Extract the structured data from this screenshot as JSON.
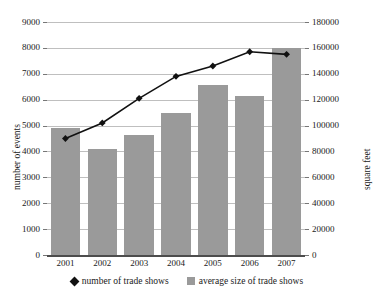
{
  "chart_data": {
    "type": "bar",
    "title": "",
    "categories": [
      "2001",
      "2002",
      "2003",
      "2004",
      "2005",
      "2006",
      "2007"
    ],
    "series": [
      {
        "name": "number of trade shows",
        "type": "line",
        "axis": "left",
        "marker": "diamond",
        "color": "#111111",
        "values": [
          4500,
          5100,
          6050,
          6900,
          7300,
          7850,
          7750
        ]
      },
      {
        "name": "average size of trade shows",
        "type": "bar",
        "axis": "right",
        "color": "#9a9a9a",
        "values": [
          98000,
          82000,
          93000,
          110000,
          131000,
          123000,
          160000
        ]
      }
    ],
    "xlabel": "",
    "ylabel": "number of events",
    "ylabel_right": "square feet",
    "ylim": [
      0,
      9000
    ],
    "ylim_right": [
      0,
      180000
    ],
    "yticks": [
      0,
      1000,
      2000,
      3000,
      4000,
      5000,
      6000,
      7000,
      8000,
      9000
    ],
    "yticks_right": [
      0,
      20000,
      40000,
      60000,
      80000,
      100000,
      120000,
      140000,
      160000,
      180000
    ],
    "ytick_labels": [
      "0",
      "1000",
      "2000",
      "3000",
      "4000",
      "5000",
      "6000",
      "7000",
      "8000",
      "9000"
    ],
    "ytick_labels_right": [
      "0",
      "20000",
      "40000",
      "60000",
      "80000",
      "100000",
      "120000",
      "140000",
      "160000",
      "180000"
    ],
    "grid": true,
    "legend_position": "bottom",
    "legend": [
      "number of trade shows",
      "average size of trade shows"
    ]
  }
}
